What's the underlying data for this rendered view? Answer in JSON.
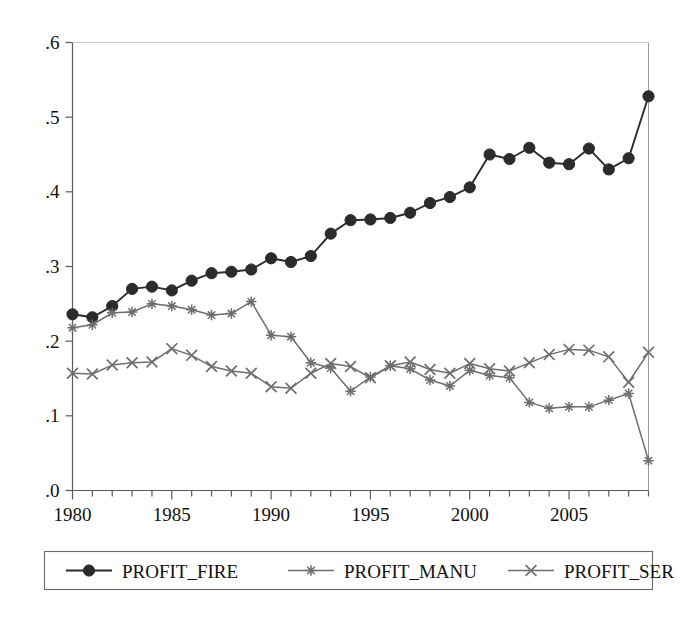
{
  "chart_data": {
    "type": "line",
    "title": "",
    "subtitle": "",
    "xlabel": "",
    "ylabel": "",
    "xlim": [
      1980,
      2009
    ],
    "ylim": [
      0.0,
      0.6
    ],
    "grid": false,
    "legend_position": "bottom",
    "x": [
      1980,
      1981,
      1982,
      1983,
      1984,
      1985,
      1986,
      1987,
      1988,
      1989,
      1990,
      1991,
      1992,
      1993,
      1994,
      1995,
      1996,
      1997,
      1998,
      1999,
      2000,
      2001,
      2002,
      2003,
      2004,
      2005,
      2006,
      2007,
      2008,
      2009
    ],
    "x_tick_labels": [
      "1980",
      "1985",
      "1990",
      "1995",
      "2000",
      "2005"
    ],
    "x_tick_values": [
      1980,
      1985,
      1990,
      1995,
      2000,
      2005
    ],
    "y_tick_labels": [
      ".0",
      ".1",
      ".2",
      ".3",
      ".4",
      ".5",
      ".6"
    ],
    "y_tick_values": [
      0.0,
      0.1,
      0.2,
      0.3,
      0.4,
      0.5,
      0.6
    ],
    "series": [
      {
        "name": "PROFIT_FIRE",
        "marker": "filled-circle",
        "color": "#2b2b2b",
        "values": [
          0.236,
          0.232,
          0.247,
          0.27,
          0.273,
          0.268,
          0.281,
          0.291,
          0.293,
          0.296,
          0.311,
          0.306,
          0.314,
          0.344,
          0.362,
          0.363,
          0.365,
          0.372,
          0.385,
          0.393,
          0.406,
          0.45,
          0.444,
          0.459,
          0.439,
          0.437,
          0.458,
          0.43,
          0.445,
          0.528
        ]
      },
      {
        "name": "PROFIT_MANU",
        "marker": "asterisk",
        "color": "#6e6e6e",
        "values": [
          0.218,
          0.222,
          0.238,
          0.239,
          0.25,
          0.247,
          0.242,
          0.235,
          0.237,
          0.253,
          0.208,
          0.206,
          0.171,
          0.164,
          0.133,
          0.152,
          0.167,
          0.163,
          0.148,
          0.14,
          0.161,
          0.154,
          0.151,
          0.118,
          0.11,
          0.112,
          0.112,
          0.121,
          0.13,
          0.04
        ]
      },
      {
        "name": "PROFIT_SER",
        "marker": "x-cross",
        "color": "#6e6e6e",
        "values": [
          0.157,
          0.156,
          0.168,
          0.171,
          0.172,
          0.19,
          0.181,
          0.166,
          0.16,
          0.157,
          0.139,
          0.137,
          0.157,
          0.17,
          0.166,
          0.151,
          0.167,
          0.172,
          0.162,
          0.157,
          0.17,
          0.163,
          0.16,
          0.171,
          0.182,
          0.189,
          0.188,
          0.179,
          0.145,
          0.185
        ]
      }
    ]
  },
  "legend": {
    "entries": [
      {
        "label": "PROFIT_FIRE"
      },
      {
        "label": "PROFIT_MANU"
      },
      {
        "label": "PROFIT_SER"
      }
    ]
  }
}
